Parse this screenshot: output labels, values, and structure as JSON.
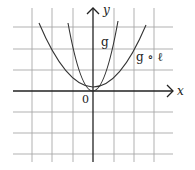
{
  "diagram": {
    "axes": {
      "x_label": "x",
      "y_label": "y",
      "origin_label": "0"
    },
    "curves": [
      {
        "name": "g",
        "label": "g",
        "description": "steeper parabola through origin"
      },
      {
        "name": "g-compose-l",
        "label": "g ∘ ℓ",
        "description": "wider parabola through origin"
      }
    ],
    "colors": {
      "grid": "#9a9a9a",
      "axis": "#222222",
      "curve": "#333333"
    }
  }
}
